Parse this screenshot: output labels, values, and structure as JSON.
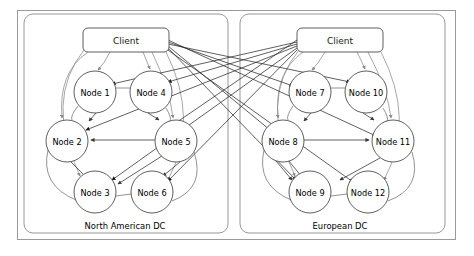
{
  "diagram": {
    "canvas": {
      "width": 474,
      "height": 256
    },
    "colors": {
      "background": "#ffffff",
      "outer_frame": "#9a9a9a",
      "dc_frame": "#8c8c8c",
      "node_stroke": "#4d4d4d",
      "local_edge": "#8a8a8a",
      "remote_edge": "#2b2b2b",
      "text": "#000000"
    },
    "outer_frame": {
      "x": 17,
      "y": 10,
      "width": 439,
      "height": 230
    },
    "datacenters": [
      {
        "id": "na-dc",
        "label": "North American DC",
        "label_x": 125,
        "label_y": 226,
        "frame": {
          "x": 24,
          "y": 14,
          "width": 204,
          "height": 219,
          "rx": 9
        },
        "client": {
          "label": "Client",
          "x": 83,
          "y": 28,
          "width": 86,
          "height": 24,
          "rx": 5,
          "cx": 126,
          "cy": 40
        },
        "nodes": [
          {
            "id": "n1",
            "label": "Node 1",
            "cx": 95,
            "cy": 92,
            "r": 21
          },
          {
            "id": "n4",
            "label": "Node 4",
            "cx": 151,
            "cy": 92,
            "r": 21
          },
          {
            "id": "n2",
            "label": "Node 2",
            "cx": 67,
            "cy": 141,
            "r": 21
          },
          {
            "id": "n5",
            "label": "Node 5",
            "cx": 176,
            "cy": 141,
            "r": 21
          },
          {
            "id": "n3",
            "label": "Node 3",
            "cx": 95,
            "cy": 192,
            "r": 21
          },
          {
            "id": "n6",
            "label": "Node 6",
            "cx": 152,
            "cy": 192,
            "r": 21
          }
        ]
      },
      {
        "id": "eu-dc",
        "label": "European DC",
        "label_x": 340,
        "label_y": 226,
        "frame": {
          "x": 240,
          "y": 14,
          "width": 205,
          "height": 219,
          "rx": 9
        },
        "client": {
          "label": "Client",
          "x": 297,
          "y": 28,
          "width": 86,
          "height": 24,
          "rx": 5,
          "cx": 340,
          "cy": 40
        },
        "nodes": [
          {
            "id": "n7",
            "label": "Node 7",
            "cx": 310,
            "cy": 92,
            "r": 21
          },
          {
            "id": "n10",
            "label": "Node 10",
            "cx": 366,
            "cy": 92,
            "r": 21
          },
          {
            "id": "n8",
            "label": "Node 8",
            "cx": 283,
            "cy": 141,
            "r": 21
          },
          {
            "id": "n11",
            "label": "Node 11",
            "cx": 393,
            "cy": 141,
            "r": 21
          },
          {
            "id": "n9",
            "label": "Node 9",
            "cx": 310,
            "cy": 192,
            "r": 21
          },
          {
            "id": "n12",
            "label": "Node 12",
            "cx": 368,
            "cy": 192,
            "r": 21
          }
        ]
      }
    ],
    "edges": {
      "description": "Each Client connects to all twelve nodes; local links are gray, cross-datacenter links are black. Node rings connect neighbours within each datacenter.",
      "client_na_targets": [
        "n1",
        "n4",
        "n2",
        "n5",
        "n3",
        "n6",
        "n7",
        "n10",
        "n8",
        "n11",
        "n9",
        "n12"
      ],
      "client_eu_targets": [
        "n7",
        "n10",
        "n8",
        "n11",
        "n9",
        "n12",
        "n1",
        "n4",
        "n2",
        "n5",
        "n3",
        "n6"
      ],
      "ring_na": [
        "n1-n4",
        "n1-n2",
        "n2-n3",
        "n3-n6",
        "n6-n5",
        "n5-n4"
      ],
      "ring_eu": [
        "n7-n10",
        "n7-n8",
        "n8-n9",
        "n9-n12",
        "n12-n11",
        "n11-n10"
      ],
      "internal_na": [
        "n5-n2",
        "n5-n3",
        "n5-n6",
        "n2-n3"
      ],
      "internal_eu": [
        "n8-n11",
        "n8-n9",
        "n8-n12",
        "n11-n12"
      ]
    }
  }
}
